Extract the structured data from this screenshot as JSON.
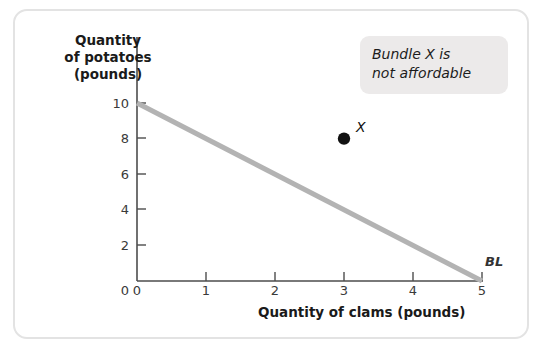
{
  "figure": {
    "background_color": "#ffffff",
    "border_color": "#e3e3e3"
  },
  "annotation": {
    "line1": "Bundle X is",
    "line2": "not affordable",
    "box_color": "#eceaea"
  },
  "chart_data": {
    "type": "line",
    "title": "",
    "xlabel": "Quantity of clams (pounds)",
    "ylabel": "Quantity of potatoes (pounds)",
    "ylabel_line1": "Quantity",
    "ylabel_line2": "of potatoes",
    "ylabel_line3": "(pounds)",
    "xlim": [
      0,
      5.35
    ],
    "ylim": [
      0,
      10.7
    ],
    "xticks": [
      "0",
      "1",
      "2",
      "3",
      "4",
      "5"
    ],
    "xtick_values": [
      0,
      1,
      2,
      3,
      4,
      5
    ],
    "yticks": [
      "0",
      "2",
      "4",
      "6",
      "8",
      "10"
    ],
    "ytick_values": [
      0,
      2,
      4,
      6,
      8,
      10
    ],
    "grid": false,
    "legend": "none",
    "series": [
      {
        "name": "BL",
        "label": "BL",
        "type": "line",
        "color": "#b3b3b3",
        "linewidth": 5,
        "x": [
          0,
          5
        ],
        "y": [
          10,
          0
        ],
        "description": "Budget line from (0,10) to (5,0)"
      }
    ],
    "points": [
      {
        "name": "X",
        "label": "X",
        "x": 3,
        "y": 8,
        "color": "#111111",
        "marker": "circle",
        "size": 9
      }
    ],
    "annotations": [
      {
        "text": "Bundle X is not affordable",
        "style": "italic",
        "box": true
      }
    ]
  }
}
